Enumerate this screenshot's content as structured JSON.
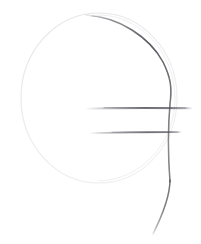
{
  "canvas": {
    "width": 201,
    "height": 244,
    "background_color": "#ffffff",
    "medium": "pencil-sketch",
    "description": "Hand-drawn pencil sketch: a faint light-gray circle outline with a darker graphite arc tracing its upper-right side and continuing below as a descending tail, crossed by two horizontal graphite strokes"
  },
  "strokes": {
    "circle_outline": {
      "name": "faint circle outline",
      "shape": "circle",
      "center_x": 99,
      "center_y": 98,
      "radius_x": 78,
      "radius_y": 85,
      "color": "#eceaea",
      "width": 1.1,
      "opacity": 1
    },
    "dark_arc": {
      "name": "dark arc along upper right of circle",
      "shape": "arc",
      "color": "#4a4a52",
      "width": 1.5,
      "start_x": 86,
      "start_y": 15,
      "end_x": 170,
      "end_y": 182,
      "peak_x": 170,
      "peak_y": 95
    },
    "tail": {
      "name": "descending tail below circle",
      "shape": "curve",
      "color": "#4a4a52",
      "width": 1.4,
      "start_x": 170,
      "start_y": 182,
      "end_x": 153,
      "end_y": 234
    },
    "upper_horizontal": {
      "name": "upper horizontal stroke",
      "shape": "line",
      "color": "#55555e",
      "width": 1.6,
      "x1": 87,
      "y1": 108,
      "x2": 191,
      "y2": 108
    },
    "lower_horizontal": {
      "name": "lower horizontal stroke",
      "shape": "line",
      "color": "#55555e",
      "width": 1.5,
      "x1": 91,
      "y1": 132,
      "x2": 181,
      "y2": 132
    }
  },
  "colors": {
    "graphite_dark": "#4a4a52",
    "graphite_mid": "#55555e",
    "graphite_faint": "#eceaea",
    "paper": "#ffffff"
  }
}
